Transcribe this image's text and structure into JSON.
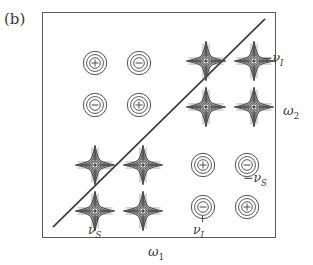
{
  "figure": {
    "panel_label": "(b)",
    "type": "2D NMR correlation spectrum schematic",
    "frame": {
      "x": 42,
      "y": 12,
      "width": 234,
      "height": 226
    }
  },
  "axes": {
    "x_label_text": "ω",
    "x_label_sub": "1",
    "y_label_text": "ω",
    "y_label_sub": "2"
  },
  "frequency_labels": [
    {
      "id": "neg-nu-I",
      "prefix": "−",
      "symbol": "ν",
      "sub": "I",
      "position": "right-upper"
    },
    {
      "id": "neg-nu-S",
      "prefix": "−",
      "symbol": "ν",
      "sub": "S",
      "position": "right-lower"
    },
    {
      "id": "nu-S",
      "prefix": "",
      "symbol": "ν",
      "sub": "S",
      "position": "bottom-left"
    },
    {
      "id": "nu-I",
      "prefix": "",
      "symbol": "ν",
      "sub": "I",
      "position": "bottom-right"
    }
  ],
  "diagonal": {
    "present": true,
    "from": {
      "x": 10,
      "y": 216
    },
    "to": {
      "x": 224,
      "y": 6
    },
    "color": "#3d3d3d"
  },
  "chart_data": {
    "type": "scatter",
    "title": "(b)",
    "xlabel": "ω₁",
    "ylabel": "ω₂",
    "grid": false,
    "legend": "none",
    "xlim": [
      0,
      234
    ],
    "ylim": [
      0,
      226
    ],
    "clusters": [
      {
        "id": "top-left-absorptive",
        "shape": "circle-contours",
        "center": {
          "x": 52,
          "y": 50
        },
        "spacing": {
          "x": 44,
          "y": 42
        },
        "peaks": [
          {
            "row": 0,
            "col": 0,
            "sign": "+"
          },
          {
            "row": 0,
            "col": 1,
            "sign": "−"
          },
          {
            "row": 1,
            "col": 0,
            "sign": "−"
          },
          {
            "row": 1,
            "col": 1,
            "sign": "+"
          }
        ]
      },
      {
        "id": "top-right-dispersive",
        "shape": "star-contours",
        "center": {
          "x": 163,
          "y": 48
        },
        "spacing": {
          "x": 48,
          "y": 46
        },
        "peaks": [
          {
            "row": 0,
            "col": 0,
            "sign": ""
          },
          {
            "row": 0,
            "col": 1,
            "sign": ""
          },
          {
            "row": 1,
            "col": 0,
            "sign": ""
          },
          {
            "row": 1,
            "col": 1,
            "sign": ""
          }
        ]
      },
      {
        "id": "bottom-left-dispersive",
        "shape": "star-contours",
        "center": {
          "x": 52,
          "y": 152
        },
        "spacing": {
          "x": 48,
          "y": 46
        },
        "peaks": [
          {
            "row": 0,
            "col": 0,
            "sign": ""
          },
          {
            "row": 0,
            "col": 1,
            "sign": ""
          },
          {
            "row": 1,
            "col": 0,
            "sign": ""
          },
          {
            "row": 1,
            "col": 1,
            "sign": ""
          }
        ]
      },
      {
        "id": "bottom-right-absorptive",
        "shape": "circle-contours",
        "center": {
          "x": 160,
          "y": 152
        },
        "spacing": {
          "x": 44,
          "y": 42
        },
        "peaks": [
          {
            "row": 0,
            "col": 0,
            "sign": "+"
          },
          {
            "row": 0,
            "col": 1,
            "sign": "−"
          },
          {
            "row": 1,
            "col": 0,
            "sign": "−"
          },
          {
            "row": 1,
            "col": 1,
            "sign": "+"
          }
        ]
      }
    ]
  },
  "colors": {
    "ink": "#3a3a3a",
    "frame": "#5a5a5a",
    "contour": "#4a4a4a",
    "background": "#ffffff"
  }
}
